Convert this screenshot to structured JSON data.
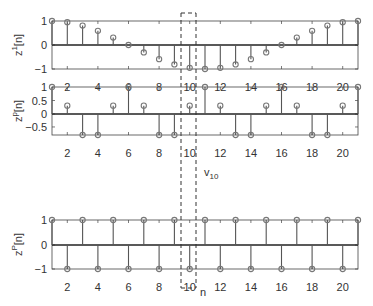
{
  "chart_data": [
    {
      "type": "stem",
      "ylabel": "z^1[n]",
      "ylabel_base": "z",
      "ylabel_sup": "1",
      "ylabel_suffix": "[n]",
      "x": [
        1,
        2,
        3,
        4,
        5,
        6,
        7,
        8,
        9,
        10,
        11,
        12,
        13,
        14,
        15,
        16,
        17,
        18,
        19,
        20,
        21
      ],
      "values": [
        1,
        0.95,
        0.81,
        0.59,
        0.31,
        0,
        -0.31,
        -0.59,
        -0.81,
        -0.95,
        -1,
        -0.95,
        -0.81,
        -0.59,
        -0.31,
        0,
        0.31,
        0.59,
        0.81,
        0.95,
        1
      ],
      "xlim": [
        1,
        21
      ],
      "ylim": [
        -1,
        1
      ],
      "xticks": [
        "2",
        "4",
        "6",
        "8",
        "10",
        "12",
        "14",
        "16",
        "18",
        "20"
      ],
      "yticks": [
        "1",
        "0",
        "−1"
      ]
    },
    {
      "type": "stem",
      "ylabel": "z^p[n]",
      "ylabel_base": "z",
      "ylabel_sup": "p",
      "ylabel_suffix": "[n]",
      "x": [
        1,
        2,
        3,
        4,
        5,
        6,
        7,
        8,
        9,
        10,
        11,
        12,
        13,
        14,
        15,
        16,
        17,
        18,
        19,
        20,
        21
      ],
      "values": [
        1,
        0.31,
        -0.81,
        -0.81,
        0.31,
        1,
        0.31,
        -0.81,
        -0.81,
        0.31,
        1,
        0.31,
        -0.81,
        -0.81,
        0.31,
        1,
        0.31,
        -0.81,
        -0.81,
        0.31,
        1
      ],
      "xlim": [
        1,
        21
      ],
      "ylim": [
        -0.81,
        1
      ],
      "xticks": [
        "2",
        "4",
        "6",
        "8",
        "10",
        "12",
        "14",
        "16",
        "18",
        "20"
      ],
      "yticks": [
        "1",
        "0.5",
        "0",
        "−0.5"
      ]
    },
    {
      "type": "stem",
      "ylabel": "z^P[n]",
      "ylabel_base": "z",
      "ylabel_sup": "P",
      "ylabel_suffix": "[n]",
      "x": [
        1,
        2,
        3,
        4,
        5,
        6,
        7,
        8,
        9,
        10,
        11,
        12,
        13,
        14,
        15,
        16,
        17,
        18,
        19,
        20,
        21
      ],
      "values": [
        1,
        -1,
        1,
        -1,
        1,
        -1,
        1,
        -1,
        1,
        -1,
        1,
        -1,
        1,
        -1,
        1,
        -1,
        1,
        -1,
        1,
        -1,
        1
      ],
      "xlim": [
        1,
        21
      ],
      "ylim": [
        -1,
        1
      ],
      "xticks": [
        "2",
        "4",
        "6",
        "8",
        "10",
        "12",
        "14",
        "16",
        "18",
        "20"
      ],
      "yticks": [
        "1",
        "0",
        "−1"
      ]
    }
  ],
  "annotations": {
    "highlight_column": 10,
    "vector_label_base": "v",
    "vector_label_sub": "10",
    "xlabel": "n"
  },
  "colors": {
    "stem": "#555555",
    "marker": "#777777",
    "axis": "#444444",
    "dashed": "#333333"
  }
}
